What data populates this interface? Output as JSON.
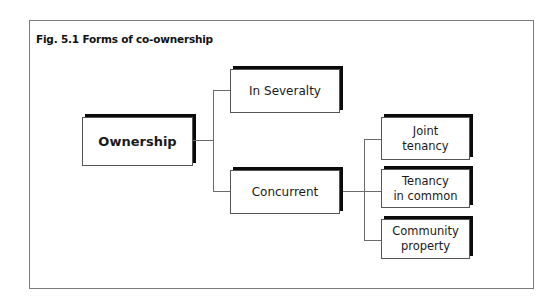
{
  "figure": {
    "title": "Fig. 5.1  Forms of co-ownership"
  },
  "diagram": {
    "root": {
      "label": "Ownership"
    },
    "level1": [
      {
        "label": "In Severalty"
      },
      {
        "label": "Concurrent"
      }
    ],
    "concurrent_children": [
      {
        "label_line1": "Joint",
        "label_line2": "tenancy"
      },
      {
        "label_line1": "Tenancy",
        "label_line2": "in common"
      },
      {
        "label_line1": "Community",
        "label_line2": "property"
      }
    ]
  },
  "colors": {
    "box_shadow": "#0a0a0a",
    "box_border": "#555555",
    "connector": "#6a6a6a",
    "frame": "#7a7a7a",
    "background": "#ffffff"
  }
}
